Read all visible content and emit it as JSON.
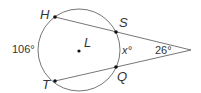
{
  "diagram": {
    "circle": {
      "name": "L",
      "center_label": "L"
    },
    "points": {
      "H": {
        "label": "H"
      },
      "S": {
        "label": "S"
      },
      "Q": {
        "label": "Q"
      },
      "T": {
        "label": "T"
      }
    },
    "arcs": {
      "major_arc_HT": "106°",
      "minor_arc_SQ": "x°"
    },
    "angle": {
      "vertex_angle": "26°"
    },
    "colors": {
      "stroke": "#555555",
      "dot": "#111111",
      "text": "#333333"
    }
  }
}
